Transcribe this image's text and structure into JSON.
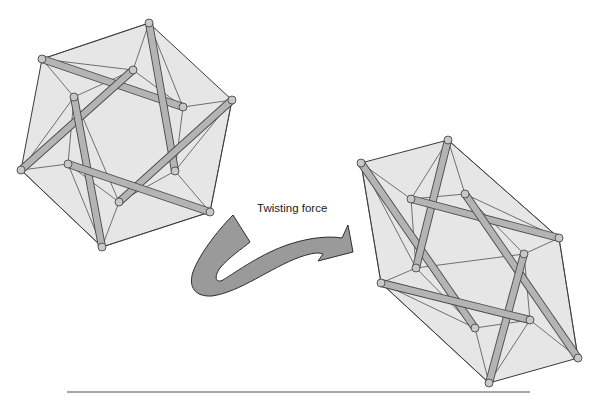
{
  "figure": {
    "label": "Twisting force",
    "left_structure": {
      "name": "tensegrity icosahedron (relaxed)",
      "vertices": [
        [
          149,
          23
        ],
        [
          42,
          59
        ],
        [
          133,
          70
        ],
        [
          74,
          97
        ],
        [
          232,
          100
        ],
        [
          183,
          107
        ],
        [
          21,
          170
        ],
        [
          68,
          164
        ],
        [
          175,
          171
        ],
        [
          119,
          202
        ],
        [
          210,
          212
        ],
        [
          102,
          247
        ]
      ],
      "hull": [
        0,
        4,
        10,
        11,
        6,
        1
      ],
      "struts": [
        [
          1,
          5
        ],
        [
          2,
          6
        ],
        [
          0,
          8
        ],
        [
          3,
          11
        ],
        [
          4,
          9
        ],
        [
          7,
          10
        ]
      ],
      "tendons": [
        [
          1,
          2
        ],
        [
          1,
          3
        ],
        [
          2,
          0
        ],
        [
          0,
          5
        ],
        [
          2,
          3
        ],
        [
          5,
          4
        ],
        [
          4,
          8
        ],
        [
          8,
          5
        ],
        [
          3,
          7
        ],
        [
          6,
          7
        ],
        [
          6,
          3
        ],
        [
          7,
          9
        ],
        [
          9,
          11
        ],
        [
          11,
          10
        ],
        [
          10,
          8
        ],
        [
          9,
          8
        ],
        [
          2,
          5
        ],
        [
          3,
          9
        ],
        [
          6,
          11
        ],
        [
          1,
          0
        ],
        [
          7,
          11
        ],
        [
          4,
          10
        ]
      ]
    },
    "right_structure": {
      "name": "tensegrity icosahedron (twisted)",
      "vertices": [
        [
          448,
          140
        ],
        [
          361,
          163
        ],
        [
          411,
          199
        ],
        [
          465,
          194
        ],
        [
          559,
          238
        ],
        [
          524,
          254
        ],
        [
          416,
          268
        ],
        [
          381,
          283
        ],
        [
          475,
          328
        ],
        [
          530,
          320
        ],
        [
          578,
          358
        ],
        [
          489,
          383
        ]
      ],
      "hull": [
        0,
        4,
        10,
        11,
        7,
        1
      ],
      "struts": [
        [
          1,
          8
        ],
        [
          0,
          6
        ],
        [
          2,
          4
        ],
        [
          3,
          10
        ],
        [
          5,
          11
        ],
        [
          7,
          9
        ]
      ],
      "tendons": [
        [
          1,
          2
        ],
        [
          1,
          6
        ],
        [
          0,
          2
        ],
        [
          0,
          3
        ],
        [
          2,
          6
        ],
        [
          3,
          4
        ],
        [
          0,
          4
        ],
        [
          4,
          5
        ],
        [
          5,
          9
        ],
        [
          9,
          10
        ],
        [
          4,
          10
        ],
        [
          6,
          7
        ],
        [
          7,
          8
        ],
        [
          8,
          11
        ],
        [
          6,
          5
        ],
        [
          8,
          9
        ],
        [
          3,
          5
        ],
        [
          2,
          3
        ],
        [
          7,
          11
        ],
        [
          11,
          9
        ],
        [
          1,
          7
        ],
        [
          6,
          8
        ]
      ]
    },
    "arrow": {
      "name": "twisting-force-arrow",
      "color": "#9a9a9a"
    },
    "rule": {
      "x1": 67,
      "y1": 392,
      "x2": 530,
      "y2": 392
    }
  }
}
